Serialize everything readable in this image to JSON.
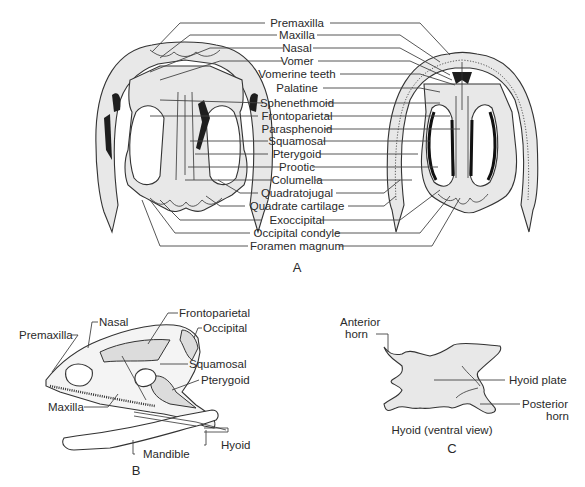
{
  "figure": {
    "panel_a": {
      "letter": "A",
      "labels": [
        "Premaxilla",
        "Maxilla",
        "Nasal",
        "Vomer",
        "Vomerine teeth",
        "Palatine",
        "Sphenethmoid",
        "Frontoparietal",
        "Parasphenoid",
        "Squamosal",
        "Pterygoid",
        "Prootic",
        "Columella",
        "Quadratojugal",
        "Quadrate cartilage",
        "Exoccipital",
        "Occipital condyle",
        "Foramen magnum"
      ]
    },
    "panel_b": {
      "letter": "B",
      "labels": {
        "premaxilla": "Premaxilla",
        "nasal": "Nasal",
        "frontoparietal": "Frontoparietal",
        "occipital": "Occipital",
        "squamosal": "Squamosal",
        "pterygoid": "Pterygoid",
        "maxilla": "Maxilla",
        "hyoid": "Hyoid",
        "mandible": "Mandible"
      }
    },
    "panel_c": {
      "letter": "C",
      "caption": "Hyoid (ventral view)",
      "labels": {
        "anterior_1": "Anterior",
        "anterior_2": "horn",
        "hyoid_plate": "Hyoid plate",
        "posterior_1": "Posterior",
        "posterior_2": "horn"
      }
    }
  }
}
